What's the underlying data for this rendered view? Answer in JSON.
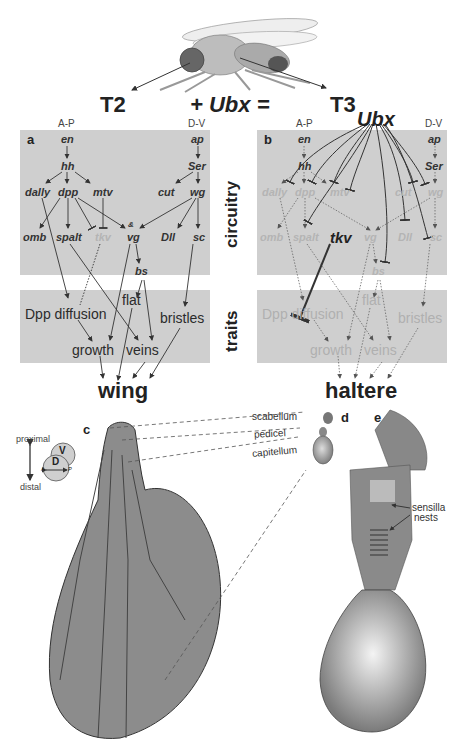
{
  "header": {
    "t2": "T2",
    "equation": "+ Ubx =",
    "t3": "T3",
    "ubx_source": "Ubx"
  },
  "panel_a": {
    "letter": "a",
    "axis_ap": "A-P",
    "axis_dv": "D-V",
    "genes": {
      "en": "en",
      "hh": "hh",
      "dally": "dally",
      "dpp": "dpp",
      "mtv": "mtv",
      "omb": "omb",
      "spalt": "spalt",
      "tkv": "tkv",
      "vg": "vg",
      "amp": "&",
      "bs": "bs",
      "ap": "ap",
      "Ser": "Ser",
      "cut": "cut",
      "wg": "wg",
      "Dll": "Dll",
      "sc": "sc"
    },
    "traits": {
      "dpp_diffusion": "Dpp diffusion",
      "flat": "flat",
      "bristles": "bristles",
      "growth": "growth",
      "veins": "veins"
    },
    "output": "wing"
  },
  "panel_b": {
    "letter": "b",
    "axis_ap": "A-P",
    "axis_dv": "D-V",
    "genes": {
      "en": "en",
      "hh": "hh",
      "dally": "dally",
      "dpp": "dpp",
      "mtv": "mtv",
      "omb": "omb",
      "spalt": "spalt",
      "tkv": "tkv",
      "vg": "vg",
      "bs": "bs",
      "ap": "ap",
      "Ser": "Ser",
      "cut": "cut",
      "wg": "wg",
      "Dll": "Dll",
      "sc": "sc"
    },
    "traits": {
      "dpp_diffusion": "Dpp diffusion",
      "flat": "flat",
      "bristles": "bristles",
      "growth": "growth",
      "veins": "veins"
    },
    "output": "haltere"
  },
  "row_labels": {
    "circuitry": "circuitry",
    "traits": "traits"
  },
  "panel_c": {
    "letter": "c",
    "proximal": "proximal",
    "distal": "distal",
    "v": "V",
    "d": "D",
    "a": "A",
    "p": "P"
  },
  "panel_d": {
    "letter": "d",
    "scabellum": "scabellum",
    "pedicel": "pedicel",
    "capitellum": "capitellum"
  },
  "panel_e": {
    "letter": "e",
    "sensilla": "sensilla",
    "nests": "nests"
  },
  "colors": {
    "panel_bg": "#cfcfcf",
    "organ_fill": "#8c8c8c",
    "dim_text": "#b4b4b4",
    "text": "#2b2b2b"
  }
}
